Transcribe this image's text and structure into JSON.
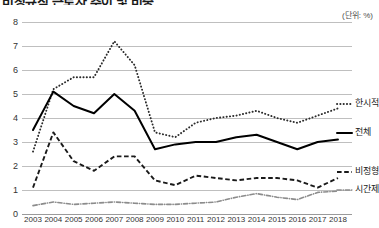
{
  "header": {
    "title": "비정규직 근로자 추이 및 비중",
    "unit_label": "(단위: %)"
  },
  "legend": {
    "items": [
      {
        "label": "한시적",
        "style": "dotted",
        "color": "#2b2b2b"
      },
      {
        "label": "전체",
        "style": "solid",
        "color": "#000000"
      },
      {
        "label": "비정형",
        "style": "dashed",
        "color": "#1a1a1a"
      },
      {
        "label": "시간제",
        "style": "dashdot",
        "color": "#8c8c8c"
      }
    ]
  },
  "axis": {
    "y_ticks": [
      "8",
      "7",
      "6",
      "5",
      "4",
      "3",
      "2",
      "1",
      "0"
    ],
    "x_ticks": [
      "2003",
      "2004",
      "2005",
      "2006",
      "2007",
      "2008",
      "2009",
      "2010",
      "2011",
      "2012",
      "2013",
      "2014",
      "2015",
      "2016",
      "2017",
      "2018"
    ]
  },
  "chart_data": {
    "type": "line",
    "title": "비정규직 근로자 추이 및 비중",
    "xlabel": "",
    "ylabel": "",
    "unit": "%",
    "grid": true,
    "legend_position": "right",
    "ylim": [
      0,
      8
    ],
    "categories": [
      "2003",
      "2004",
      "2005",
      "2006",
      "2007",
      "2008",
      "2009",
      "2010",
      "2011",
      "2012",
      "2013",
      "2014",
      "2015",
      "2016",
      "2017",
      "2018"
    ],
    "series": [
      {
        "name": "한시적",
        "style": "dotted",
        "values": [
          2.6,
          5.2,
          5.7,
          5.7,
          7.2,
          6.2,
          3.4,
          3.2,
          3.8,
          4.0,
          4.1,
          4.3,
          4.0,
          3.8,
          4.1,
          4.4
        ]
      },
      {
        "name": "전체",
        "style": "solid",
        "values": [
          3.5,
          5.1,
          4.5,
          4.2,
          5.0,
          4.3,
          2.7,
          2.9,
          3.0,
          3.0,
          3.2,
          3.3,
          3.0,
          2.7,
          3.0,
          3.1
        ]
      },
      {
        "name": "비정형",
        "style": "dashed",
        "values": [
          1.1,
          3.4,
          2.2,
          1.8,
          2.4,
          2.4,
          1.4,
          1.2,
          1.6,
          1.5,
          1.4,
          1.5,
          1.5,
          1.4,
          1.1,
          1.5
        ]
      },
      {
        "name": "시간제",
        "style": "dashdot",
        "values": [
          0.35,
          0.5,
          0.4,
          0.45,
          0.5,
          0.45,
          0.4,
          0.4,
          0.45,
          0.5,
          0.7,
          0.85,
          0.7,
          0.6,
          0.9,
          0.95
        ]
      }
    ]
  }
}
